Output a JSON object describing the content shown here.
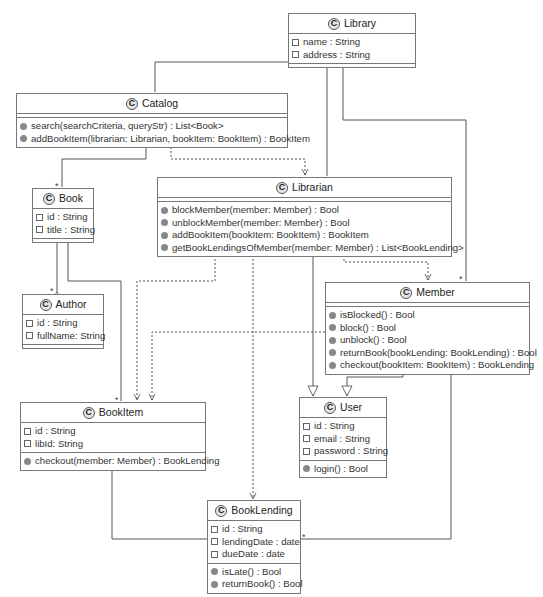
{
  "diagram": {
    "type": "UML class diagram",
    "class_stereotype_glyph": "C",
    "colors": {
      "line": "#555555",
      "border": "#777777",
      "text": "#333333",
      "icon_fill": "#888888"
    }
  },
  "classes": {
    "library": {
      "name": "Library",
      "fields": [
        "name : String",
        "address : String"
      ],
      "methods": []
    },
    "catalog": {
      "name": "Catalog",
      "fields": [],
      "methods": [
        "search(searchCriteria, queryStr) : List<Book>",
        "addBookItem(librarian: Librarian, bookItem: BookItem) : BookItem"
      ]
    },
    "book": {
      "name": "Book",
      "fields": [
        "id : String",
        "title : String"
      ],
      "methods": []
    },
    "librarian": {
      "name": "Librarian",
      "fields": [],
      "methods": [
        "blockMember(member: Member) : Bool",
        "unblockMember(member: Member) : Bool",
        "addBookItem(bookItem: BookItem) : BookItem",
        "getBookLendingsOfMember(member: Member) : List<BookLending>"
      ]
    },
    "author": {
      "name": "Author",
      "fields": [
        "id : String",
        "fullName: String"
      ],
      "methods": []
    },
    "member": {
      "name": "Member",
      "fields": [],
      "methods": [
        "isBlocked() : Bool",
        "block() : Bool",
        "unblock() : Bool",
        "returnBook(bookLending: BookLending) : Bool",
        "checkout(bookItem: BookItem) : BookLending"
      ]
    },
    "bookitem": {
      "name": "BookItem",
      "fields": [
        "id : String",
        "libId: String"
      ],
      "methods": [
        "checkout(member: Member) : BookLending"
      ]
    },
    "user": {
      "name": "User",
      "fields": [
        "id : String",
        "email : String",
        "password : String"
      ],
      "methods": [
        "login() : Bool"
      ]
    },
    "booklending": {
      "name": "BookLending",
      "fields": [
        "id : String",
        "lendingDate : date",
        "dueDate : date"
      ],
      "methods": [
        "isLate() : Bool",
        "returnBook() : Bool"
      ]
    }
  },
  "relations": [
    {
      "from": "Library",
      "to": "Catalog",
      "kind": "composition"
    },
    {
      "from": "Library",
      "to": "Librarian",
      "kind": "composition",
      "multiplicity": "*"
    },
    {
      "from": "Library",
      "to": "Member",
      "kind": "composition",
      "multiplicity": "*"
    },
    {
      "from": "Catalog",
      "to": "Book",
      "kind": "composition",
      "multiplicity": "*"
    },
    {
      "from": "Catalog",
      "to": "Librarian",
      "kind": "dependency"
    },
    {
      "from": "Book",
      "to": "Author",
      "kind": "aggregation",
      "multiplicity": "*"
    },
    {
      "from": "Book",
      "to": "BookItem",
      "kind": "composition",
      "multiplicity": "*"
    },
    {
      "from": "Librarian",
      "to": "BookItem",
      "kind": "dependency"
    },
    {
      "from": "Librarian",
      "to": "BookLending",
      "kind": "dependency"
    },
    {
      "from": "Librarian",
      "to": "Member",
      "kind": "dependency"
    },
    {
      "from": "Librarian",
      "to": "User",
      "kind": "generalization"
    },
    {
      "from": "Member",
      "to": "BookItem",
      "kind": "dependency"
    },
    {
      "from": "Member",
      "to": "User",
      "kind": "generalization"
    },
    {
      "from": "Member",
      "to": "BookLending",
      "kind": "composition",
      "multiplicity": "*"
    },
    {
      "from": "BookItem",
      "to": "BookLending",
      "kind": "composition"
    }
  ],
  "multiplicity_label": "*"
}
